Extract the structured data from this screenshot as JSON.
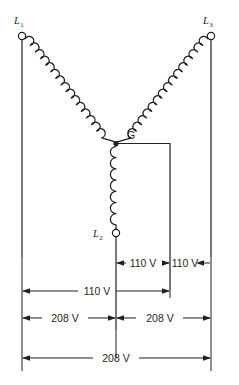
{
  "diagram": {
    "type": "electrical-schematic",
    "colors": {
      "line": "#231f20",
      "background": "#ffffff"
    },
    "terminals": [
      {
        "id": "L1",
        "label": "L",
        "subscript": "1",
        "x": 22,
        "y": 35
      },
      {
        "id": "L3",
        "label": "L",
        "subscript": "3",
        "x": 211,
        "y": 35
      },
      {
        "id": "L2",
        "label": "L",
        "subscript": "2",
        "x": 116,
        "y": 233
      }
    ],
    "neutral": {
      "id": "G",
      "label": "G",
      "x": 116,
      "y": 143
    },
    "windings": [
      {
        "name": "winding-l1-to-g",
        "from": "L1",
        "to": "G",
        "turns": 11
      },
      {
        "name": "winding-l3-to-g",
        "from": "L3",
        "to": "G",
        "turns": 9
      },
      {
        "name": "winding-g-to-l2",
        "from": "G",
        "to": "L2",
        "turns": 6
      }
    ],
    "dimensions": [
      {
        "id": "dim-center-to-ground",
        "label": "110 V",
        "row": 1,
        "from_x": 116,
        "to_x": 170,
        "arrows": "both-outward"
      },
      {
        "id": "dim-ground-to-right",
        "label": "110 V",
        "row": 1,
        "from_x": 170,
        "to_x": 211,
        "arrows": "right-inward"
      },
      {
        "id": "dim-left-to-ground",
        "label": "110 V",
        "row": 2,
        "from_x": 22,
        "to_x": 170,
        "arrows": "both-outward"
      },
      {
        "id": "dim-left-to-center",
        "label": "208 V",
        "row": 3,
        "from_x": 22,
        "to_x": 116,
        "arrows": "both-outward"
      },
      {
        "id": "dim-center-to-right",
        "label": "208 V",
        "row": 3,
        "from_x": 116,
        "to_x": 211,
        "arrows": "both-outward"
      },
      {
        "id": "dim-left-to-right",
        "label": "208 V",
        "row": 4,
        "from_x": 22,
        "to_x": 211,
        "arrows": "both-outward"
      }
    ]
  }
}
